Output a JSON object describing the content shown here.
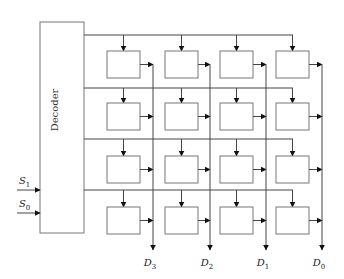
{
  "diagram": {
    "decoder": {
      "label": "Decoder",
      "x": 40,
      "y": 22,
      "w": 44,
      "h": 211
    },
    "inputs": [
      {
        "label": "S",
        "sub": "1",
        "y": 190
      },
      {
        "label": "S",
        "sub": "0",
        "y": 213
      }
    ],
    "outputs": [
      {
        "label": "D",
        "sub": "3",
        "x": 153
      },
      {
        "label": "D",
        "sub": "2",
        "x": 210
      },
      {
        "label": "D",
        "sub": "1",
        "x": 266
      },
      {
        "label": "D",
        "sub": "0",
        "x": 322
      }
    ],
    "row_lines_y": [
      35,
      88,
      139,
      190
    ],
    "cell_rows_y": [
      51,
      103,
      156,
      207
    ],
    "cell_cols_x": [
      107,
      165,
      220,
      276
    ],
    "cell_size": {
      "w": 33,
      "h": 27
    },
    "colors": {
      "line": "#444444",
      "box": "#777777"
    }
  }
}
